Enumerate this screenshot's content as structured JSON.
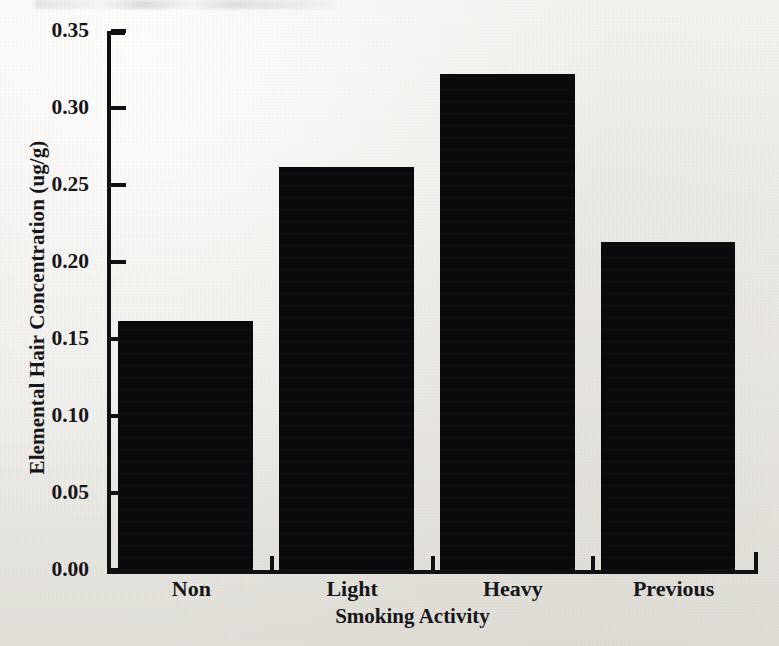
{
  "figure": {
    "background_color": "#efedea",
    "ink_color": "#101014",
    "bar_color": "#0a0a0d"
  },
  "chart_data": {
    "type": "bar",
    "title": "",
    "subtitle": "",
    "xlabel": "Smoking Activity",
    "ylabel": "Elemental Hair Concentration (ug/g)",
    "categories": [
      "Non",
      "Light",
      "Heavy",
      "Previous"
    ],
    "values": [
      0.162,
      0.262,
      0.322,
      0.213
    ],
    "series": [
      {
        "name": "Elemental Hair Concentration",
        "values": [
          0.162,
          0.262,
          0.322,
          0.213
        ]
      }
    ],
    "ylim": [
      0.0,
      0.35
    ],
    "ytick_labels": [
      "0.35",
      "0.30",
      "0.25",
      "0.20",
      "0.15",
      "0.10",
      "0.05",
      "0.00"
    ],
    "ytick_values": [
      0.35,
      0.3,
      0.25,
      0.2,
      0.15,
      0.1,
      0.05,
      0.0
    ],
    "ytick_interval": 0.05,
    "xtick_labels": [
      "Non",
      "Light",
      "Heavy",
      "Previous"
    ],
    "grid": false,
    "legend": "none",
    "bar_fill": "solid-black",
    "annotations": []
  }
}
